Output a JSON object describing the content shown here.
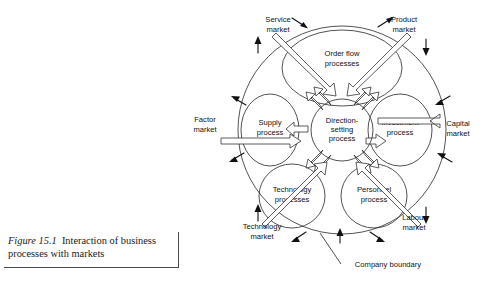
{
  "figure": {
    "number": "Figure 15.1",
    "title": "Interaction of business processes with markets",
    "caption_line1": "Figure 15.1",
    "caption_line2": "Interaction of business",
    "caption_line3": "processes with markets"
  },
  "diagram": {
    "type": "circular-process-diagram",
    "center": {
      "label": "Direction-setting process",
      "line1": "Direction-",
      "line2": "setting",
      "line3": "process"
    },
    "boundary": {
      "label": "Company boundary"
    },
    "processes": [
      {
        "id": "order-flow",
        "line1": "Order flow",
        "line2": "processes",
        "position": "top"
      },
      {
        "id": "supply",
        "line1": "Supply",
        "line2": "process",
        "position": "left"
      },
      {
        "id": "investment",
        "line1": "Investment",
        "line2": "process",
        "position": "right"
      },
      {
        "id": "technology",
        "line1": "Technology",
        "line2": "processes",
        "position": "bottom-left"
      },
      {
        "id": "personnel",
        "line1": "Personnel",
        "line2": "process",
        "position": "bottom-right"
      }
    ],
    "markets": [
      {
        "id": "service",
        "line1": "Service",
        "line2": "market",
        "position": "top-left"
      },
      {
        "id": "product",
        "line1": "Product",
        "line2": "market",
        "position": "top-right"
      },
      {
        "id": "factor",
        "line1": "Factor",
        "line2": "market",
        "position": "left"
      },
      {
        "id": "capital",
        "line1": "Capital",
        "line2": "market",
        "position": "right"
      },
      {
        "id": "technology",
        "line1": "Technology",
        "line2": "market",
        "position": "bottom-left"
      },
      {
        "id": "labour",
        "line1": "Labour",
        "line2": "market",
        "position": "bottom-right"
      }
    ],
    "colors": {
      "line": "#333333",
      "text": "#111111",
      "background": "#ffffff"
    }
  }
}
